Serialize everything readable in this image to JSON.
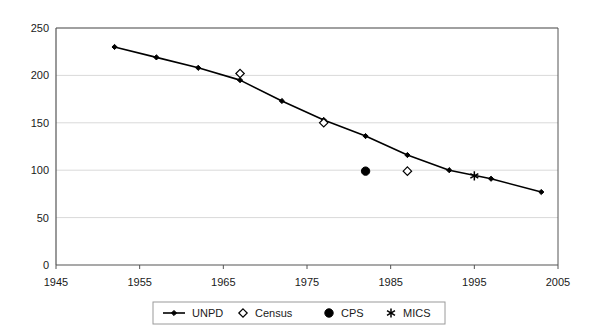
{
  "chart_data": {
    "type": "line",
    "title": "",
    "subtitle": "",
    "xlabel": "",
    "ylabel": "",
    "xlim": [
      1945,
      2005
    ],
    "ylim": [
      0,
      250
    ],
    "xticks": [
      1945,
      1955,
      1965,
      1975,
      1985,
      1995,
      2005
    ],
    "yticks": [
      0,
      50,
      100,
      150,
      200,
      250
    ],
    "xtick_labels": [
      "1945",
      "1955",
      "1965",
      "1975",
      "1985",
      "1995",
      "2005"
    ],
    "ytick_labels": [
      "0",
      "50",
      "100",
      "150",
      "200",
      "250"
    ],
    "grid": "horizontal",
    "legend_position": "bottom",
    "plot_background": "#ffffff",
    "series": [
      {
        "name": "UNPD",
        "marker": "line-with-diamond",
        "color": "#000000",
        "x": [
          1952,
          1957,
          1962,
          1967,
          1972,
          1977,
          1982,
          1987,
          1992,
          1997,
          2003
        ],
        "values": [
          230,
          219,
          208,
          195,
          173,
          153,
          136,
          116,
          100,
          91,
          77
        ]
      },
      {
        "name": "Census",
        "marker": "open-diamond",
        "color": "#000000",
        "x": [
          1967,
          1977,
          1987
        ],
        "values": [
          202,
          150,
          99
        ]
      },
      {
        "name": "CPS",
        "marker": "filled-circle",
        "color": "#000000",
        "x": [
          1982
        ],
        "values": [
          99
        ]
      },
      {
        "name": "MICS",
        "marker": "asterisk",
        "color": "#000000",
        "x": [
          1995
        ],
        "values": [
          94
        ]
      }
    ]
  },
  "legend": {
    "items": [
      {
        "label": "UNPD",
        "marker": "line-with-diamond"
      },
      {
        "label": "Census",
        "marker": "open-diamond"
      },
      {
        "label": "CPS",
        "marker": "filled-circle"
      },
      {
        "label": "MICS",
        "marker": "asterisk"
      }
    ]
  },
  "axes": {
    "y_labels": [
      "250",
      "200",
      "150",
      "100",
      "50",
      "0"
    ],
    "x_labels": [
      "1945",
      "1955",
      "1965",
      "1975",
      "1985",
      "1995",
      "2005"
    ]
  },
  "colors": {
    "series": "#000000",
    "axis": "#555555",
    "grid": "#d9d9d9",
    "text": "#1a1a1a",
    "background": "#ffffff"
  }
}
